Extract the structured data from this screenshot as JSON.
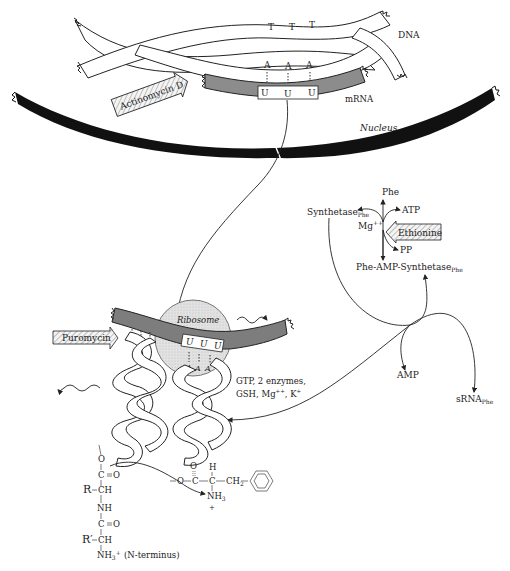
{
  "dna": {
    "label": "DNA",
    "template_bases": [
      "T",
      "T",
      "T"
    ],
    "coding_bases": [
      "A",
      "A",
      "A"
    ]
  },
  "mrna": {
    "label": "mRNA",
    "codon": [
      "U",
      "U",
      "U"
    ]
  },
  "inhibitors": {
    "actinomycin": "Actinomycin D",
    "puromycin": "Puromycin",
    "ethionine": "Ethionine"
  },
  "nucleus": {
    "label": "Nucleus"
  },
  "ribosome": {
    "label": "Ribosome",
    "codon": [
      "U",
      "U",
      "U"
    ],
    "anticodon": [
      "A",
      "A",
      "A"
    ]
  },
  "activation": {
    "phe": "Phe",
    "atp": "ATP",
    "synthetase": "Synthetase",
    "synthetase_sub": "Phe",
    "mg": "Mg",
    "mg_sup": "++",
    "pp": "PP",
    "complex": "Phe-AMP-Synthetase",
    "complex_sub": "Phe",
    "amp": "AMP",
    "srna": "sRNA",
    "srna_sub": "Phe"
  },
  "cofactors": {
    "line1": "GTP, 2 enzymes,",
    "line2_a": "GSH, Mg",
    "line2_sup1": "++",
    "line2_b": ", K",
    "line2_sup2": "+"
  },
  "chemistry": {
    "O1": "O",
    "C1": "C",
    "eqO1": "O",
    "R": "R",
    "CH1": "CH",
    "NH": "NH",
    "C2": "C",
    "eqO2": "O",
    "Rprime": "R′",
    "CH2": "CH",
    "nh3": "NH",
    "nh3_sub": "3",
    "nh3_sup": "+",
    "nterm": "(N-terminus)",
    "phe_O": "O",
    "phe_O2": "O",
    "phe_C": "C",
    "phe_CH": "C",
    "phe_H": "H",
    "phe_CH2": "CH",
    "phe_CH2_sub": "2",
    "phe_NH3": "NH",
    "phe_NH3_sub": "3",
    "phe_plus": "+"
  }
}
